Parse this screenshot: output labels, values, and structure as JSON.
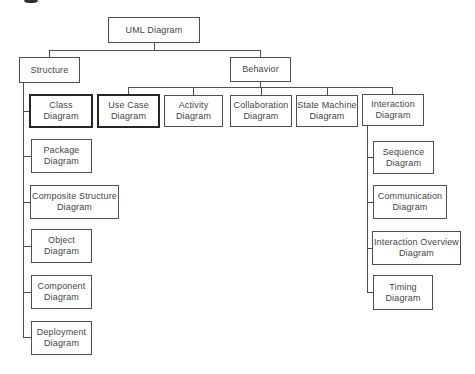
{
  "diagram": {
    "title": "UML Diagram",
    "hierarchy": {
      "root": "UML Diagram",
      "children": [
        {
          "label": "Structure",
          "children": [
            "Class Diagram",
            "Package Diagram",
            "Composite Structure Diagram",
            "Object Diagram",
            "Component Diagram",
            "Deployment Diagram"
          ]
        },
        {
          "label": "Behavior",
          "children": [
            "Use Case Diagram",
            "Activity Diagram",
            "Collaboration Diagram",
            "State Machine Diagram",
            {
              "label": "Interaction Diagram",
              "children": [
                "Sequence Diagram",
                "Communication Diagram",
                "Interaction Overview Diagram",
                "Timing Diagram"
              ]
            }
          ]
        }
      ]
    },
    "colors": {
      "background": "#ffffff",
      "box_border": "#4f4f4f",
      "box_border_emphasis": "#262626",
      "text": "#454545",
      "connector": "#4f4f4f"
    },
    "nodes": [
      {
        "id": "uml-diagram",
        "label": "UML Diagram",
        "x": 108,
        "y": 17,
        "w": 92,
        "h": 26,
        "border": "thin"
      },
      {
        "id": "structure",
        "label": "Structure",
        "x": 19,
        "y": 57,
        "w": 61,
        "h": 26,
        "border": "thin"
      },
      {
        "id": "behavior",
        "label": "Behavior",
        "x": 230,
        "y": 57,
        "w": 61,
        "h": 25,
        "border": "thin"
      },
      {
        "id": "class-diagram",
        "label": "Class\nDiagram",
        "x": 29,
        "y": 94,
        "w": 64,
        "h": 34,
        "border": "thick"
      },
      {
        "id": "use-case-diagram",
        "label": "Use Case\nDiagram",
        "x": 97,
        "y": 94,
        "w": 63,
        "h": 34,
        "border": "thick"
      },
      {
        "id": "activity-diagram",
        "label": "Activity\nDiagram",
        "x": 164,
        "y": 95,
        "w": 59,
        "h": 32,
        "border": "thin"
      },
      {
        "id": "collaboration-diagram",
        "label": "Collaboration\nDiagram",
        "x": 230,
        "y": 95,
        "w": 62,
        "h": 32,
        "border": "thin"
      },
      {
        "id": "state-machine-diagram",
        "label": "State Machine\nDiagram",
        "x": 296,
        "y": 95,
        "w": 62,
        "h": 32,
        "border": "thin"
      },
      {
        "id": "interaction-diagram",
        "label": "Interaction\nDiagram",
        "x": 362,
        "y": 94,
        "w": 62,
        "h": 32,
        "border": "thin"
      },
      {
        "id": "package-diagram",
        "label": "Package\nDiagram",
        "x": 31,
        "y": 139,
        "w": 61,
        "h": 34,
        "border": "thin"
      },
      {
        "id": "composite-structure-diagram",
        "label": "Composite Structure\nDiagram",
        "x": 30,
        "y": 185,
        "w": 89,
        "h": 34,
        "border": "thin"
      },
      {
        "id": "object-diagram",
        "label": "Object\nDiagram",
        "x": 31,
        "y": 229,
        "w": 61,
        "h": 34,
        "border": "thin"
      },
      {
        "id": "component-diagram",
        "label": "Component\nDiagram",
        "x": 31,
        "y": 275,
        "w": 61,
        "h": 34,
        "border": "thin"
      },
      {
        "id": "deployment-diagram",
        "label": "Deployment\nDiagram",
        "x": 31,
        "y": 321,
        "w": 61,
        "h": 34,
        "border": "thin"
      },
      {
        "id": "sequence-diagram",
        "label": "Sequence\nDiagram",
        "x": 373,
        "y": 141,
        "w": 61,
        "h": 33,
        "border": "thin"
      },
      {
        "id": "communication-diagram",
        "label": "Communication\nDiagram",
        "x": 373,
        "y": 185,
        "w": 74,
        "h": 34,
        "border": "thin"
      },
      {
        "id": "interaction-overview-diagram",
        "label": "Interaction Overview\nDiagram",
        "x": 372,
        "y": 231,
        "w": 89,
        "h": 34,
        "border": "thin"
      },
      {
        "id": "timing-diagram",
        "label": "Timing\nDiagram",
        "x": 373,
        "y": 275,
        "w": 60,
        "h": 35,
        "border": "thin"
      }
    ],
    "connectors": [
      {
        "id": "uml-drop",
        "x": 154,
        "y": 43,
        "w": 1,
        "h": 8
      },
      {
        "id": "level1-rail",
        "x": 49,
        "y": 50,
        "w": 212,
        "h": 1
      },
      {
        "id": "structure-drop",
        "x": 49,
        "y": 50,
        "w": 1,
        "h": 8
      },
      {
        "id": "behavior-drop",
        "x": 260,
        "y": 50,
        "w": 1,
        "h": 8
      },
      {
        "id": "behavior-stem",
        "x": 260,
        "y": 82,
        "w": 1,
        "h": 6
      },
      {
        "id": "behavior-rail",
        "x": 128,
        "y": 87,
        "w": 265,
        "h": 1
      },
      {
        "id": "use-case-drop",
        "x": 128,
        "y": 87,
        "w": 1,
        "h": 8
      },
      {
        "id": "activity-drop",
        "x": 193,
        "y": 87,
        "w": 1,
        "h": 9
      },
      {
        "id": "collaboration-drop",
        "x": 261,
        "y": 87,
        "w": 1,
        "h": 9
      },
      {
        "id": "state-machine-drop",
        "x": 327,
        "y": 87,
        "w": 1,
        "h": 9
      },
      {
        "id": "interaction-drop",
        "x": 392,
        "y": 87,
        "w": 1,
        "h": 8
      },
      {
        "id": "structure-spine",
        "x": 23,
        "y": 83,
        "w": 1,
        "h": 255
      },
      {
        "id": "class-stub",
        "x": 23,
        "y": 111,
        "w": 7,
        "h": 1
      },
      {
        "id": "package-stub",
        "x": 23,
        "y": 156,
        "w": 9,
        "h": 1
      },
      {
        "id": "composite-stub",
        "x": 23,
        "y": 202,
        "w": 8,
        "h": 1
      },
      {
        "id": "object-stub",
        "x": 23,
        "y": 246,
        "w": 9,
        "h": 1
      },
      {
        "id": "component-stub",
        "x": 23,
        "y": 292,
        "w": 9,
        "h": 1
      },
      {
        "id": "deployment-stub",
        "x": 23,
        "y": 337,
        "w": 9,
        "h": 1
      },
      {
        "id": "interaction-spine",
        "x": 367,
        "y": 126,
        "w": 1,
        "h": 166
      },
      {
        "id": "sequence-stub",
        "x": 367,
        "y": 157,
        "w": 7,
        "h": 1
      },
      {
        "id": "communication-stub",
        "x": 367,
        "y": 202,
        "w": 7,
        "h": 1
      },
      {
        "id": "interaction-overview-stub",
        "x": 367,
        "y": 248,
        "w": 6,
        "h": 1
      },
      {
        "id": "timing-stub",
        "x": 367,
        "y": 292,
        "w": 7,
        "h": 1
      }
    ]
  }
}
